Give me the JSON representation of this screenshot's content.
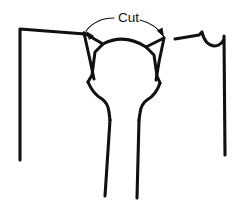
{
  "diagram": {
    "title": "Cut",
    "background_color": "#ffffff",
    "ink_color": "#111111",
    "type": "garment-pattern-line-drawing",
    "annotation": {
      "label": "Cut",
      "label_x": 118,
      "label_y": 22,
      "leader_left": {
        "from_x": 114,
        "from_y": 18,
        "ctrl_x": 96,
        "ctrl_y": 18,
        "to_x": 86,
        "to_y": 31,
        "arrow_angle": 232
      },
      "leader_right": {
        "from_x": 140,
        "from_y": 20,
        "ctrl_x": 156,
        "ctrl_y": 24,
        "to_x": 164,
        "to_y": 37,
        "arrow_angle": 61
      }
    },
    "shapes": {
      "left_sleeve": "M 20 160 L 20 29 L 85 34",
      "right_sleeve": "M 175 39 L 199 35 L 202 32 Q 205 45 214 46 Q 221 46 224 39 L 224 36 L 225 155",
      "left_dart": "M 84 33 L 103 44 L 95 52 L 92 75 L 88 82",
      "left_dart_inner": "M 84 33 L 90 60 L 94 79",
      "right_dart": "M 164 38 L 146 47 L 154 55 L 157 76 L 160 83",
      "right_dart_inner": "M 164 38 L 159 62 L 156 80",
      "center_funnel_left": "M 88 82 Q 93 94 102 99 Q 108 103 109 112 L 110 120",
      "center_funnel_right": "M 160 83 Q 156 95 147 100 Q 141 104 140 113 L 139 120",
      "leg_left": "M 110 120 L 105 196",
      "leg_right": "M 139 120 L 137 198",
      "neck_arc": "M 103 44 Q 124 33 146 47"
    }
  }
}
